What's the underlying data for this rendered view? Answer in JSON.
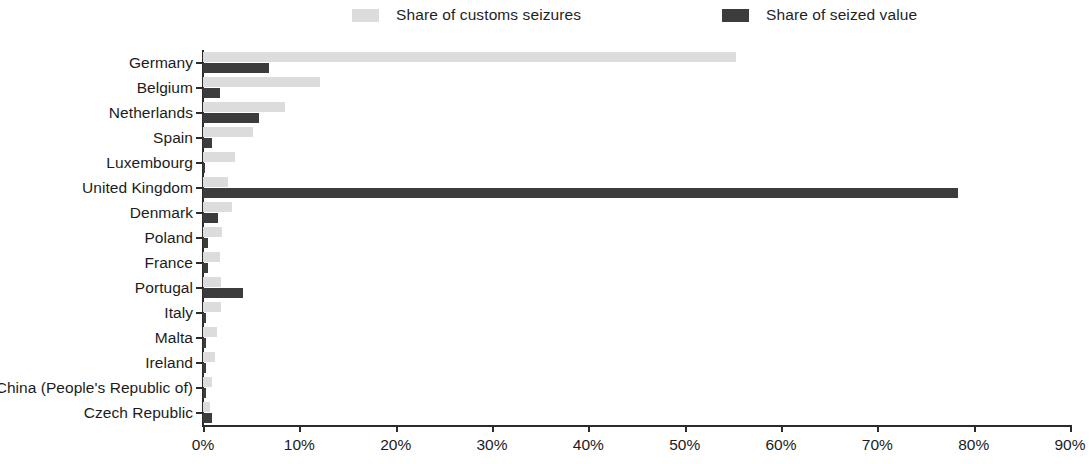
{
  "chart_data": {
    "type": "bar",
    "orientation": "horizontal",
    "grouped": true,
    "title": "",
    "xlabel": "",
    "ylabel": "",
    "xlim": [
      0,
      90
    ],
    "xtick_labels": [
      "0%",
      "10%",
      "20%",
      "30%",
      "40%",
      "50%",
      "60%",
      "70%",
      "80%",
      "90%"
    ],
    "xtick_values": [
      0,
      10,
      20,
      30,
      40,
      50,
      60,
      70,
      80,
      90
    ],
    "grid": false,
    "legend_position": "top",
    "categories": [
      "Germany",
      "Belgium",
      "Netherlands",
      "Spain",
      "Luxembourg",
      "United Kingdom",
      "Denmark",
      "Poland",
      "France",
      "Portugal",
      "Italy",
      "Malta",
      "Ireland",
      "China (People's Republic of)",
      "Czech Republic"
    ],
    "series": [
      {
        "name": "Share of customs seizures",
        "color": "#dcdcdc",
        "values": [
          55.3,
          12.1,
          8.5,
          5.2,
          3.3,
          2.6,
          3.0,
          2.0,
          1.8,
          1.9,
          1.9,
          1.5,
          1.2,
          0.9,
          0.7
        ]
      },
      {
        "name": "Share of seized value",
        "color": "#3c3c3c",
        "values": [
          6.9,
          1.8,
          5.8,
          0.9,
          0.2,
          78.4,
          1.6,
          0.5,
          0.5,
          4.2,
          0.3,
          0.3,
          0.3,
          0.3,
          0.9
        ]
      }
    ]
  },
  "legend": {
    "entries": [
      {
        "label": "Share of customs seizures",
        "color": "#dcdcdc"
      },
      {
        "label": "Share of seized value",
        "color": "#3c3c3c"
      }
    ]
  }
}
